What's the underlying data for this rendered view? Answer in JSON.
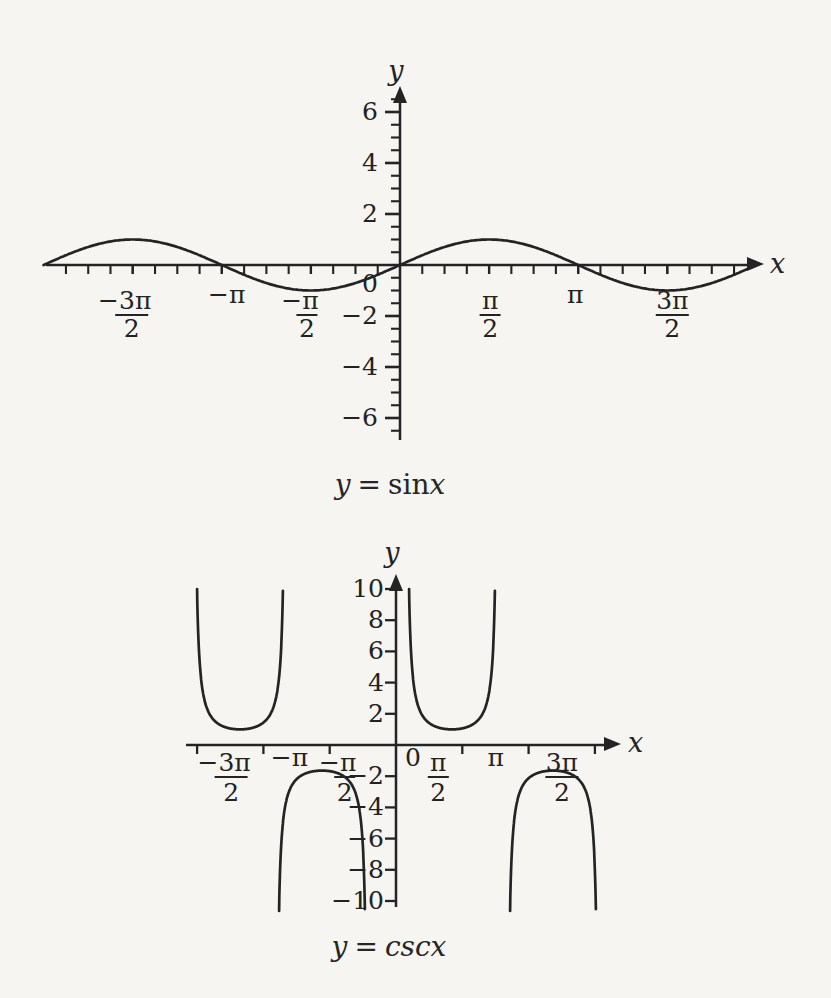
{
  "page": {
    "background": "#f6f5f2",
    "ink": "#242424"
  },
  "chart_data": [
    {
      "id": "sin",
      "type": "line",
      "title": "y = sinx",
      "xlabel": "x",
      "ylabel": "y",
      "xlim_pi": [
        -2,
        2
      ],
      "ylim": [
        -6.5,
        6.5
      ],
      "grid": false,
      "x_minor_step_pi": 0.125,
      "y_minor_step": 0.5,
      "x_ticks": [
        {
          "v": -1.5,
          "num": "−3π",
          "den": "2"
        },
        {
          "v": -1.0,
          "text": "−π"
        },
        {
          "v": -0.5,
          "num": "−π",
          "den": "2"
        },
        {
          "v": 0.5,
          "num": "π",
          "den": "2"
        },
        {
          "v": 1.0,
          "text": "π"
        },
        {
          "v": 1.5,
          "num": "3π",
          "den": "2"
        }
      ],
      "y_ticks": [
        {
          "v": 6,
          "label": "6"
        },
        {
          "v": 4,
          "label": "4"
        },
        {
          "v": 2,
          "label": "2"
        },
        {
          "v": 0,
          "label": "0"
        },
        {
          "v": -2,
          "label": "−2"
        },
        {
          "v": -4,
          "label": "−4"
        },
        {
          "v": -6,
          "label": "−6"
        }
      ],
      "series": [
        {
          "name": "y = sin x",
          "fn": "sin",
          "amplitude": 1,
          "period_pi": 2,
          "key_points": {
            "x_pi": [
              -2,
              -1.5,
              -1,
              -0.5,
              0,
              0.5,
              1,
              1.5,
              2
            ],
            "y": [
              0,
              1,
              0,
              -1,
              0,
              1,
              0,
              -1,
              0
            ]
          }
        }
      ],
      "caption": {
        "var": "y",
        "eq": "=",
        "fn": "sin",
        "arg": "x"
      }
    },
    {
      "id": "csc",
      "type": "line",
      "title": "y = cscx",
      "xlabel": "x",
      "ylabel": "y",
      "xlim_pi": [
        -1.7,
        1.7
      ],
      "ylim": [
        -10,
        10
      ],
      "grid": false,
      "x_ticks": [
        {
          "v": -1.5,
          "num": "−3π",
          "den": "2"
        },
        {
          "v": -1.0,
          "text": "−π"
        },
        {
          "v": -0.5,
          "num": "−π",
          "den": "2"
        },
        {
          "v": 0,
          "text": "0"
        },
        {
          "v": 0.5,
          "num": "π",
          "den": "2"
        },
        {
          "v": 1.0,
          "text": "π"
        },
        {
          "v": 1.5,
          "num": "3π",
          "den": "2"
        }
      ],
      "y_ticks": [
        {
          "v": 10,
          "label": "10"
        },
        {
          "v": 8,
          "label": "8"
        },
        {
          "v": 6,
          "label": "6"
        },
        {
          "v": 4,
          "label": "4"
        },
        {
          "v": 2,
          "label": "2"
        },
        {
          "v": -2,
          "label": "−2"
        },
        {
          "v": -4,
          "label": "−4"
        },
        {
          "v": -6,
          "label": "−6"
        },
        {
          "v": -8,
          "label": "−8"
        },
        {
          "v": -10,
          "label": "−10"
        }
      ],
      "series": [
        {
          "name": "y = csc x",
          "fn": "csc",
          "asymptotes_x_pi": [
            -2,
            -1,
            0,
            1,
            2
          ],
          "branch_extrema": [
            {
              "x_pi": -1.5,
              "y": 1
            },
            {
              "x_pi": -0.5,
              "y": -1
            },
            {
              "x_pi": 0.5,
              "y": 1
            },
            {
              "x_pi": 1.5,
              "y": -1
            }
          ],
          "branch_clip_y": 10
        }
      ],
      "caption": {
        "var": "y",
        "eq": "=",
        "fn": "csc",
        "arg": "x"
      }
    }
  ]
}
